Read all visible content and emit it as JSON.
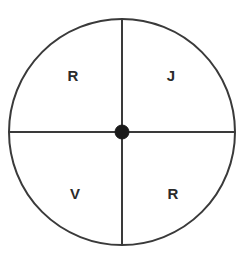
{
  "diagram": {
    "kind": "quartered-circle-diagram",
    "background_color": "#ffffff",
    "stroke_color": "#3a3a3a",
    "hub_color": "#1a1a1a",
    "label_color": "#2b2b2b",
    "circle": {
      "center_x": 122,
      "center_y": 132,
      "radius": 113,
      "stroke_width": 2
    },
    "hub": {
      "radius": 7
    },
    "vertical_divider": {
      "x": 122,
      "y_start": 19,
      "y_end": 245,
      "stroke_width": 2
    },
    "horizontal_divider": {
      "y": 132,
      "x_start": 9,
      "x_end": 235,
      "stroke_width": 2
    },
    "quadrants": [
      {
        "position": "top-left",
        "label": "R"
      },
      {
        "position": "top-right",
        "label": "J"
      },
      {
        "position": "bottom-left",
        "label": "V"
      },
      {
        "position": "bottom-right",
        "label": "R"
      }
    ]
  }
}
